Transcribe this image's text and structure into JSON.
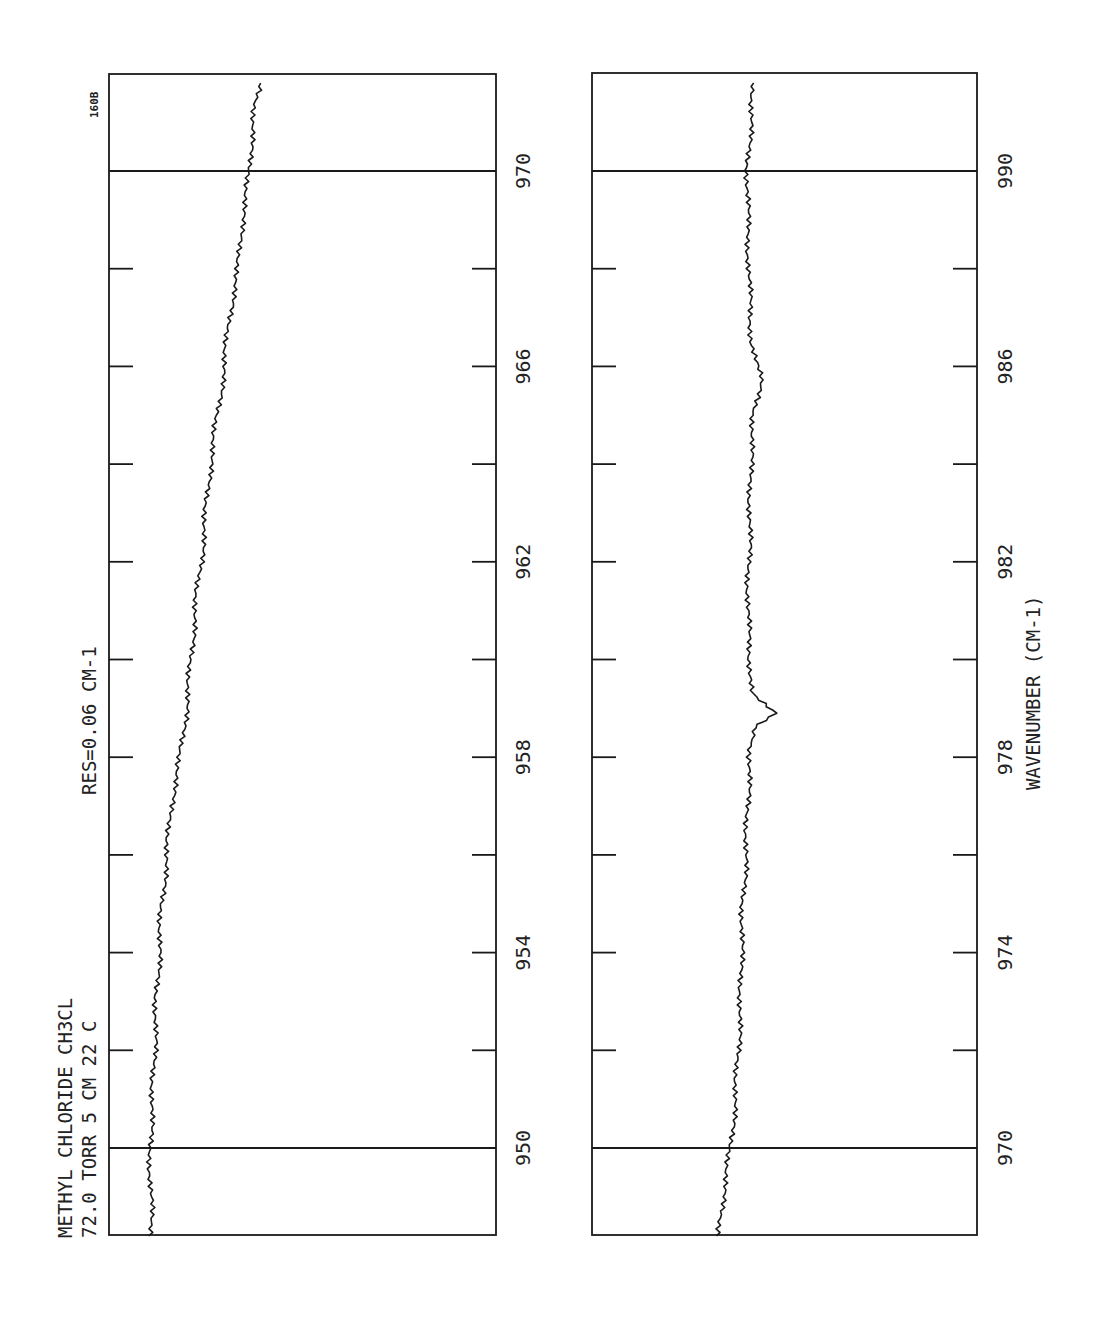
{
  "figure_id_label": "160B",
  "annotations": {
    "line1": "METHYL CHLORIDE  CH3CL",
    "line2": "72.0 TORR  5 CM  22 C",
    "resolution": "RES=0.06 CM-1"
  },
  "colors": {
    "ink": "#1a1a1a",
    "background": "#ffffff"
  },
  "chart_data": [
    {
      "type": "line",
      "title": "Methyl chloride CH3Cl, 72.0 torr, 5 cm, 22 C, RES=0.06 cm-1",
      "orientation": "rotated-90 (wavenumber increases upward)",
      "xlabel": "",
      "ylabel": "",
      "wavenumber_range": [
        948.2,
        972
      ],
      "major_ticks": [
        950,
        954,
        958,
        962,
        966,
        970
      ],
      "minor_ticks": [
        952,
        956,
        960,
        964,
        968
      ],
      "tick_labels": [
        "950",
        "954",
        "958",
        "962",
        "966",
        "970"
      ],
      "grid": false,
      "series": [
        {
          "name": "transmittance (relative)",
          "x": [
            948.2,
            949,
            950,
            951,
            952,
            953,
            954,
            955,
            956,
            957,
            958,
            959,
            960,
            961,
            962,
            963,
            964,
            965,
            966,
            967,
            968,
            969,
            970,
            971,
            971.8
          ],
          "values": [
            0.112,
            0.108,
            0.106,
            0.112,
            0.118,
            0.122,
            0.13,
            0.136,
            0.15,
            0.16,
            0.184,
            0.2,
            0.212,
            0.222,
            0.238,
            0.25,
            0.262,
            0.28,
            0.298,
            0.31,
            0.334,
            0.344,
            0.364,
            0.37,
            0.392
          ]
        }
      ]
    },
    {
      "type": "line",
      "title": "",
      "orientation": "rotated-90 (wavenumber increases upward)",
      "xlabel": "WAVENUMBER (CM-1)",
      "ylabel": "",
      "wavenumber_range": [
        968.2,
        992
      ],
      "major_ticks": [
        970,
        974,
        978,
        982,
        986,
        990
      ],
      "minor_ticks": [
        972,
        976,
        980,
        984,
        988
      ],
      "tick_labels": [
        "970",
        "974",
        "978",
        "982",
        "986",
        "990"
      ],
      "grid": false,
      "series": [
        {
          "name": "transmittance (relative)",
          "x": [
            968.2,
            969,
            970,
            971,
            972,
            973,
            974,
            975,
            976,
            977,
            978,
            978.6,
            978.9,
            979.3,
            980,
            981,
            982,
            983,
            984,
            985,
            985.8,
            986.5,
            987,
            988,
            989,
            990,
            991,
            991.8
          ],
          "values": [
            0.33,
            0.34,
            0.36,
            0.372,
            0.38,
            0.386,
            0.388,
            0.392,
            0.4,
            0.404,
            0.41,
            0.418,
            0.482,
            0.42,
            0.41,
            0.404,
            0.408,
            0.41,
            0.412,
            0.42,
            0.44,
            0.416,
            0.41,
            0.408,
            0.404,
            0.404,
            0.412,
            0.42
          ]
        }
      ]
    }
  ]
}
